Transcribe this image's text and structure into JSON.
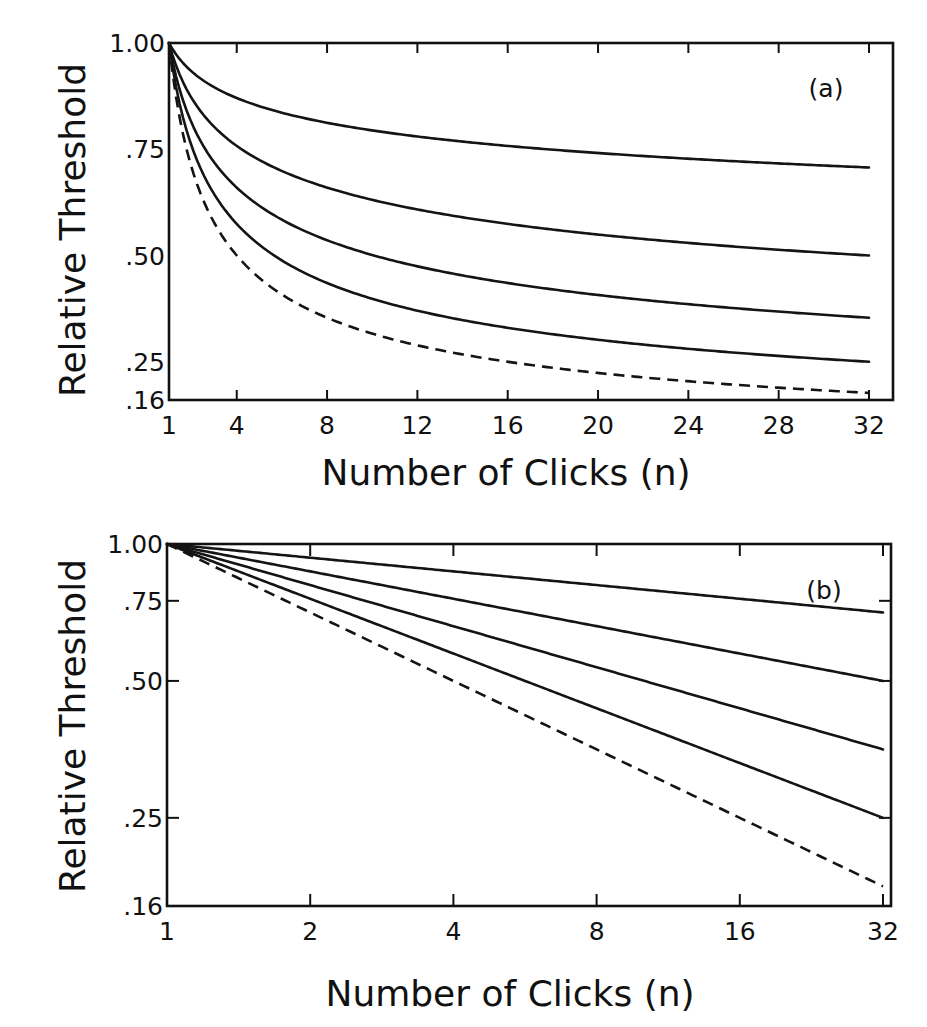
{
  "chart_data": [
    {
      "type": "line",
      "panel_label": "(a)",
      "title": "",
      "xlabel": "Number of Clicks (n)",
      "ylabel": "Relative Threshold",
      "xscale": "linear",
      "yscale": "linear",
      "xlim": [
        1,
        33
      ],
      "ylim": [
        0.16,
        1.0
      ],
      "xticks": [
        1,
        4,
        8,
        12,
        16,
        20,
        24,
        28,
        32
      ],
      "xtick_labels": [
        "1",
        "4",
        "8",
        "12",
        "16",
        "20",
        "24",
        "28",
        "32"
      ],
      "yticks": [
        1.0,
        0.75,
        0.5,
        0.25,
        0.16
      ],
      "ytick_labels": [
        "1.00",
        ".75",
        ".50",
        ".25",
        ".16"
      ],
      "grid": false,
      "legend": "none",
      "function": "threshold = n^(-exponent)",
      "x_range": [
        1,
        32
      ],
      "series": [
        {
          "name": "exponent 0.1",
          "exponent": 0.1,
          "style": "solid",
          "values_at": {
            "1": 1.0,
            "4": 0.87,
            "8": 0.81,
            "16": 0.76,
            "32": 0.71
          }
        },
        {
          "name": "exponent 0.2",
          "exponent": 0.2,
          "style": "solid",
          "values_at": {
            "1": 1.0,
            "4": 0.76,
            "8": 0.66,
            "16": 0.57,
            "32": 0.5
          }
        },
        {
          "name": "exponent 0.3",
          "exponent": 0.3,
          "style": "solid",
          "values_at": {
            "1": 1.0,
            "4": 0.66,
            "8": 0.54,
            "16": 0.44,
            "32": 0.35
          }
        },
        {
          "name": "exponent 0.4",
          "exponent": 0.4,
          "style": "solid",
          "values_at": {
            "1": 1.0,
            "4": 0.57,
            "8": 0.44,
            "16": 0.33,
            "32": 0.25
          }
        },
        {
          "name": "exponent 0.5",
          "exponent": 0.5,
          "style": "dashed",
          "values_at": {
            "1": 1.0,
            "4": 0.5,
            "8": 0.35,
            "16": 0.25,
            "32": 0.18
          }
        }
      ]
    },
    {
      "type": "line",
      "panel_label": "(b)",
      "title": "",
      "xlabel": "Number of Clicks (n)",
      "ylabel": "Relative Threshold",
      "xscale": "log2",
      "yscale": "log",
      "xlim": [
        1,
        32
      ],
      "ylim": [
        0.16,
        1.0
      ],
      "xticks": [
        1,
        2,
        4,
        8,
        16,
        32
      ],
      "xtick_labels": [
        "1",
        "2",
        "4",
        "8",
        "16",
        "32"
      ],
      "yticks": [
        1.0,
        0.75,
        0.5,
        0.25,
        0.16
      ],
      "ytick_labels": [
        "1.00",
        ".75",
        ".50",
        ".25",
        ".16"
      ],
      "grid": false,
      "legend": "none",
      "function": "threshold = n^(-exponent)",
      "x_range": [
        1,
        32
      ],
      "series": [
        {
          "name": "exponent 0.1",
          "exponent": 0.1,
          "style": "solid",
          "values_at": {
            "1": 1.0,
            "32": 0.71
          }
        },
        {
          "name": "exponent 0.2",
          "exponent": 0.2,
          "style": "solid",
          "values_at": {
            "1": 1.0,
            "32": 0.5
          }
        },
        {
          "name": "exponent 0.3",
          "exponent": 0.3,
          "style": "solid",
          "values_at": {
            "1": 1.0,
            "32": 0.35
          }
        },
        {
          "name": "exponent 0.4",
          "exponent": 0.4,
          "style": "solid",
          "values_at": {
            "1": 1.0,
            "32": 0.25
          }
        },
        {
          "name": "exponent 0.5",
          "exponent": 0.5,
          "style": "dashed",
          "values_at": {
            "1": 1.0,
            "32": 0.18
          }
        }
      ]
    }
  ]
}
